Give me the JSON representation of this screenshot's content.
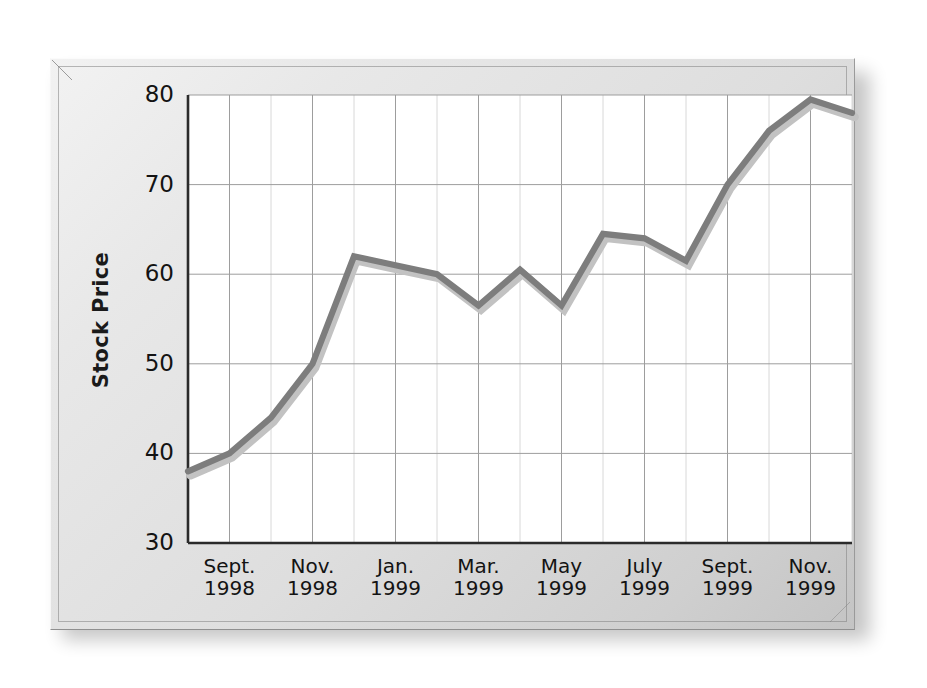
{
  "figure": {
    "frame_style": "beveled-plaque",
    "background_color": "#e4e4e4",
    "plot_background_color": "#ffffff",
    "line_color": "#7d7d7d",
    "line_shadow_color": "#bfbfbf",
    "axis_color": "#2b2b2b",
    "gridline_color": "#9d9d9d"
  },
  "chart_data": {
    "type": "line",
    "title": "",
    "subtitle": "",
    "xlabel": "",
    "ylabel": "Stock Price",
    "ylim": [
      30,
      80
    ],
    "yticks": [
      30,
      40,
      50,
      60,
      70,
      80
    ],
    "ytick_labels": [
      "30",
      "40",
      "50",
      "60",
      "70",
      "80"
    ],
    "grid": true,
    "grid_axes": "both",
    "legend": false,
    "legend_position": "none",
    "x_tick_labels": [
      {
        "month": "Sept.",
        "year": "1998"
      },
      {
        "month": "Nov.",
        "year": "1998"
      },
      {
        "month": "Jan.",
        "year": "1999"
      },
      {
        "month": "Mar.",
        "year": "1999"
      },
      {
        "month": "May",
        "year": "1999"
      },
      {
        "month": "July",
        "year": "1999"
      },
      {
        "month": "Sept.",
        "year": "1999"
      },
      {
        "month": "Nov.",
        "year": "1999"
      }
    ],
    "x": [
      "Aug. 1998",
      "Sept. 1998",
      "Oct. 1998",
      "Nov. 1998",
      "Dec. 1998",
      "Jan. 1999",
      "Feb. 1999",
      "Mar. 1999",
      "Apr. 1999",
      "May 1999",
      "June 1999",
      "July 1999",
      "Aug. 1999",
      "Sept. 1999",
      "Oct. 1999",
      "Nov. 1999",
      "Dec. 1999"
    ],
    "values": [
      38,
      40,
      44,
      50,
      62,
      61,
      60,
      56.5,
      60.5,
      56.5,
      64.5,
      64,
      61.5,
      70,
      76,
      79.5,
      78
    ],
    "series": [
      {
        "name": "Stock Price",
        "values": [
          38,
          40,
          44,
          50,
          62,
          61,
          60,
          56.5,
          60.5,
          56.5,
          64.5,
          64,
          61.5,
          70,
          76,
          79.5,
          78
        ]
      }
    ]
  }
}
